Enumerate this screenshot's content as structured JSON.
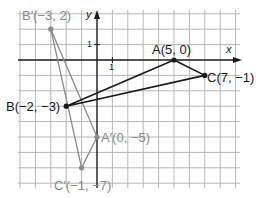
{
  "figure": {
    "type": "coordinate-grid",
    "origin_px": {
      "x": 97,
      "y": 60
    },
    "unit_px": 15.4,
    "grid": {
      "x_min": -5,
      "x_max": 9,
      "y_min": -8,
      "y_max": 3
    },
    "colors": {
      "grid": "#b8b8b8",
      "axis": "#1a1a1a",
      "original": "#1a1a1a",
      "image": "#8a8a8a"
    },
    "axes": {
      "x_label": "x",
      "y_label": "y",
      "x_tick": "1",
      "y_tick": "1"
    },
    "original_triangle": {
      "points": [
        {
          "name": "A",
          "label": "A(5, 0)",
          "x": 5,
          "y": 0
        },
        {
          "name": "B",
          "label": "B(−2, −3)",
          "x": -2,
          "y": -3
        },
        {
          "name": "C",
          "label": "C(7, −1)",
          "x": 7,
          "y": -1
        }
      ]
    },
    "image_triangle": {
      "points": [
        {
          "name": "A'",
          "label": "A′(0, −5)",
          "x": 0,
          "y": -5
        },
        {
          "name": "B'",
          "label": "B′(−3, 2)",
          "x": -3,
          "y": 2
        },
        {
          "name": "C'",
          "label": "C′(−1, −7)",
          "x": -1,
          "y": -7
        }
      ]
    }
  }
}
